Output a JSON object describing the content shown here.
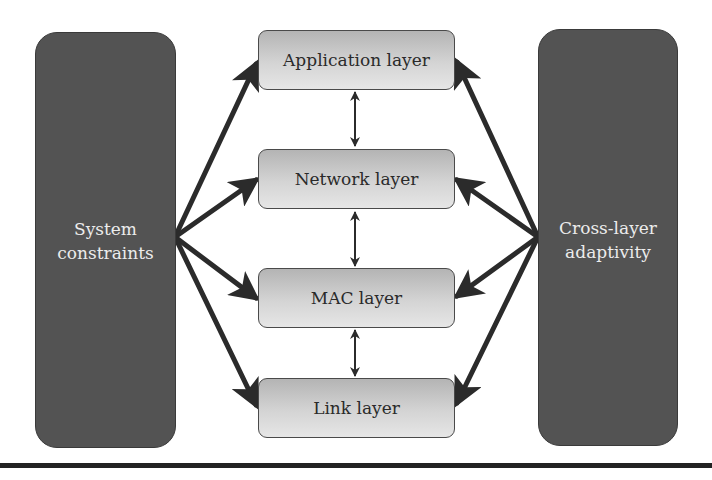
{
  "diagram": {
    "type": "cross-layer architecture",
    "left_block": {
      "lines": [
        "System",
        "constraints"
      ]
    },
    "right_block": {
      "lines": [
        "Cross-layer",
        "adaptivity"
      ]
    },
    "layers": [
      {
        "label": "Application layer"
      },
      {
        "label": "Network layer"
      },
      {
        "label": "MAC layer"
      },
      {
        "label": "Link layer"
      }
    ],
    "edges": [
      {
        "from": "System constraints",
        "to": "Application layer",
        "style": "thick-arrow"
      },
      {
        "from": "System constraints",
        "to": "Network layer",
        "style": "thick-arrow"
      },
      {
        "from": "System constraints",
        "to": "MAC layer",
        "style": "thick-arrow"
      },
      {
        "from": "System constraints",
        "to": "Link layer",
        "style": "thick-arrow"
      },
      {
        "from": "Cross-layer adaptivity",
        "to": "Application layer",
        "style": "thick-arrow"
      },
      {
        "from": "Cross-layer adaptivity",
        "to": "Network layer",
        "style": "thick-arrow"
      },
      {
        "from": "Cross-layer adaptivity",
        "to": "MAC layer",
        "style": "thick-arrow"
      },
      {
        "from": "Cross-layer adaptivity",
        "to": "Link layer",
        "style": "thick-arrow"
      },
      {
        "from": "Application layer",
        "to": "Network layer",
        "style": "thin-bidirectional"
      },
      {
        "from": "Network layer",
        "to": "MAC layer",
        "style": "thin-bidirectional"
      },
      {
        "from": "MAC layer",
        "to": "Link layer",
        "style": "thin-bidirectional"
      }
    ],
    "colors": {
      "block_fill": "#535353",
      "block_text": "#ececec",
      "layer_gradient_top": "#b4b4b4",
      "layer_gradient_bottom": "#e6e6e6",
      "arrow": "#2b2b2b"
    }
  }
}
